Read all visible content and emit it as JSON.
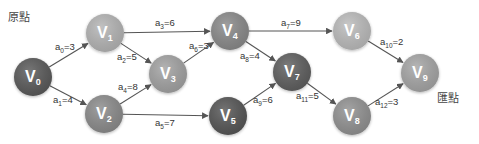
{
  "labels": {
    "source": "原點",
    "sink": "匯點"
  },
  "nodes": [
    {
      "id": "V0",
      "letter": "V",
      "sub": "0",
      "x": 33,
      "y": 77,
      "color": "#5a5a5a"
    },
    {
      "id": "V1",
      "letter": "V",
      "sub": "1",
      "x": 105,
      "y": 33,
      "color": "#b5b5b5"
    },
    {
      "id": "V2",
      "letter": "V",
      "sub": "2",
      "x": 104,
      "y": 114,
      "color": "#8c8c8c"
    },
    {
      "id": "V3",
      "letter": "V",
      "sub": "3",
      "x": 168,
      "y": 74,
      "color": "#a3a3a3"
    },
    {
      "id": "V4",
      "letter": "V",
      "sub": "4",
      "x": 230,
      "y": 31,
      "color": "#8a8a8a"
    },
    {
      "id": "V5",
      "letter": "V",
      "sub": "5",
      "x": 228,
      "y": 116,
      "color": "#565656"
    },
    {
      "id": "V6",
      "letter": "V",
      "sub": "6",
      "x": 352,
      "y": 31,
      "color": "#bcbcbc"
    },
    {
      "id": "V7",
      "letter": "V",
      "sub": "7",
      "x": 292,
      "y": 72,
      "color": "#5e5e5e"
    },
    {
      "id": "V8",
      "letter": "V",
      "sub": "8",
      "x": 352,
      "y": 116,
      "color": "#929292"
    },
    {
      "id": "V9",
      "letter": "V",
      "sub": "9",
      "x": 420,
      "y": 73,
      "color": "#a6a6a6"
    }
  ],
  "edges": [
    {
      "id": "a0",
      "from": 0,
      "to": 1,
      "name": "a",
      "sub": "0",
      "weight": "3",
      "lx": 55,
      "ly": 50
    },
    {
      "id": "a1",
      "from": 0,
      "to": 2,
      "name": "a",
      "sub": "1",
      "weight": "4",
      "lx": 53,
      "ly": 103
    },
    {
      "id": "a2",
      "from": 1,
      "to": 3,
      "name": "a",
      "sub": "2",
      "weight": "5",
      "lx": 117,
      "ly": 60
    },
    {
      "id": "a3",
      "from": 1,
      "to": 4,
      "name": "a",
      "sub": "3",
      "weight": "6",
      "lx": 155,
      "ly": 26
    },
    {
      "id": "a4",
      "from": 2,
      "to": 3,
      "name": "a",
      "sub": "4",
      "weight": "8",
      "lx": 118,
      "ly": 90
    },
    {
      "id": "a5",
      "from": 2,
      "to": 5,
      "name": "a",
      "sub": "5",
      "weight": "7",
      "lx": 155,
      "ly": 126
    },
    {
      "id": "a6",
      "from": 3,
      "to": 4,
      "name": "a",
      "sub": "6",
      "weight": "3",
      "lx": 189,
      "ly": 49
    },
    {
      "id": "a7",
      "from": 4,
      "to": 6,
      "name": "a",
      "sub": "7",
      "weight": "9",
      "lx": 281,
      "ly": 26
    },
    {
      "id": "a8",
      "from": 4,
      "to": 7,
      "name": "a",
      "sub": "8",
      "weight": "4",
      "lx": 240,
      "ly": 59
    },
    {
      "id": "a9",
      "from": 5,
      "to": 7,
      "name": "a",
      "sub": "9",
      "weight": "6",
      "lx": 253,
      "ly": 103
    },
    {
      "id": "a10",
      "from": 6,
      "to": 9,
      "name": "a",
      "sub": "10",
      "weight": "2",
      "lx": 380,
      "ly": 45
    },
    {
      "id": "a11",
      "from": 7,
      "to": 8,
      "name": "a",
      "sub": "11",
      "weight": "5",
      "lx": 296,
      "ly": 99
    },
    {
      "id": "a12",
      "from": 8,
      "to": 9,
      "name": "a",
      "sub": "12",
      "weight": "3",
      "lx": 375,
      "ly": 105
    }
  ]
}
